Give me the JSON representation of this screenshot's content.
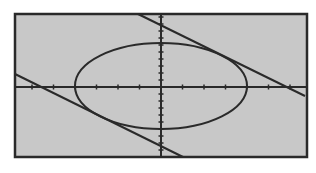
{
  "chart_data": {
    "type": "line",
    "title": "",
    "xlabel": "",
    "ylabel": "",
    "grid": false,
    "legend": null,
    "series": [
      {
        "name": "ellipse",
        "kind": "ellipse",
        "center": [
          0,
          0
        ],
        "semi_axis_x": 4,
        "semi_axis_y": 2
      },
      {
        "name": "upper tangent line",
        "kind": "line",
        "x": [
          -1,
          6.6
        ],
        "y": [
          3.4,
          -0.4
        ]
      },
      {
        "name": "lower tangent line",
        "kind": "line",
        "x": [
          -6.6,
          1
        ],
        "y": [
          0.6,
          -3.4
        ]
      }
    ],
    "axis_ticks": {
      "x_tick_count_each_side": 7,
      "y_tick_count_each_side": 3
    }
  },
  "colors": {
    "plot_background": "#c8c8c8",
    "frame": "#2a2a2a",
    "curve": "#2a2a2a",
    "page_background": "#ffffff"
  },
  "geometry": {
    "frame": {
      "x": 15,
      "y": 14,
      "w": 292,
      "h": 143
    },
    "origin": {
      "x": 161,
      "y": 87
    },
    "ellipse": {
      "cx": 161,
      "cy": 86,
      "rx": 86,
      "ry": 43
    },
    "upper_line": {
      "x1": 138,
      "y1": 14,
      "x2": 305,
      "y2": 96
    },
    "lower_line": {
      "x1": 15,
      "y1": 74,
      "x2": 183,
      "y2": 157
    },
    "x_tick_spacing": 21.5,
    "y_tick_spacing": 7
  }
}
